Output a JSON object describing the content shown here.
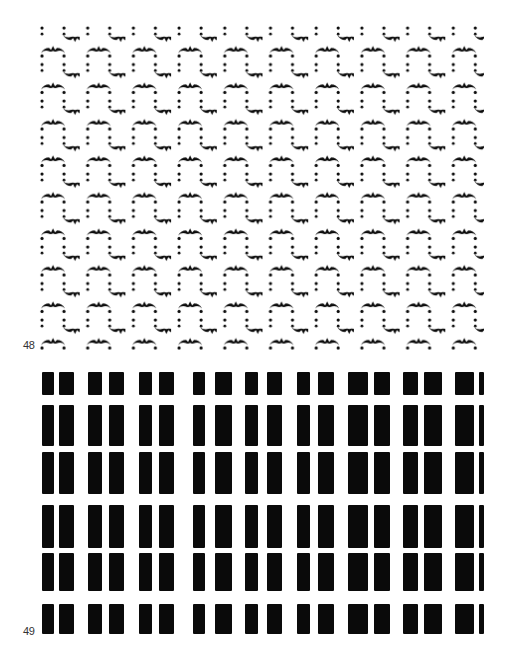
{
  "figures": [
    {
      "number": "48",
      "description": "Repeating pattern of bat-like arched motifs with dotted vertical lines",
      "motif_color": "#0a0a0a",
      "background": "#ffffff",
      "tile": {
        "width": 45.7,
        "height": 36.5
      }
    },
    {
      "number": "49",
      "description": "Grid of paired black rectangular bars",
      "bar_color": "#0a0a0a",
      "columns": [
        [
          [
            42,
            54
          ],
          [
            59,
            74
          ]
        ],
        [
          [
            88,
            102
          ],
          [
            109,
            124
          ]
        ],
        [
          [
            139,
            152
          ],
          [
            159,
            174
          ]
        ],
        [
          [
            193,
            205
          ],
          [
            215,
            232
          ]
        ],
        [
          [
            245,
            258
          ],
          [
            267,
            282
          ]
        ],
        [
          [
            297,
            310
          ],
          [
            318,
            334
          ]
        ],
        [
          [
            348,
            368
          ],
          [
            374,
            390
          ]
        ],
        [
          [
            403,
            418
          ],
          [
            424,
            442
          ]
        ],
        [
          [
            455,
            474
          ],
          [
            479,
            484
          ]
        ]
      ],
      "rows": [
        [
          372,
          395
        ],
        [
          405,
          446
        ],
        [
          452,
          494
        ],
        [
          505,
          548
        ],
        [
          553,
          591
        ],
        [
          604,
          634
        ]
      ]
    }
  ]
}
